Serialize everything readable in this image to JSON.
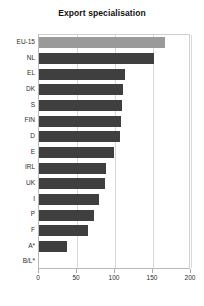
{
  "chart_data": {
    "type": "bar",
    "orientation": "horizontal",
    "title": "Export specialisation",
    "xlabel": "",
    "ylabel": "",
    "xlim": [
      0,
      200
    ],
    "xticks": [
      0,
      50,
      100,
      150,
      200
    ],
    "grid": true,
    "legend": null,
    "categories": [
      "EU-15",
      "NL",
      "EL",
      "DK",
      "S",
      "FIN",
      "D",
      "E",
      "IRL",
      "UK",
      "I",
      "P",
      "F",
      "A*",
      "B/L*"
    ],
    "values": [
      166,
      151,
      113,
      111,
      109,
      108,
      106,
      99,
      88,
      87,
      79,
      72,
      64,
      37,
      0
    ],
    "highlight_category": "EU-15",
    "colors": {
      "bar": "#3f3f3f",
      "highlight_bar": "#9a9a9a",
      "grid": "#d8d8d8",
      "axis": "#b9b9b9",
      "text": "#1a1a1a",
      "background": "#ffffff"
    }
  }
}
